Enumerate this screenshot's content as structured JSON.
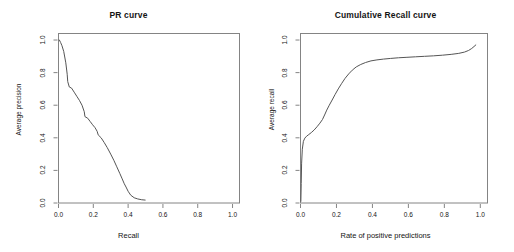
{
  "figure": {
    "width": 514,
    "height": 252,
    "background": "#ffffff",
    "line_color": "#555555",
    "axis_color": "#848484"
  },
  "panels": [
    {
      "id": "pr-curve",
      "title": "PR curve",
      "xlabel": "Recall",
      "ylabel": "Average precision",
      "xticks": [
        "0.0",
        "0.2",
        "0.4",
        "0.6",
        "0.8",
        "1.0"
      ],
      "xtick_values": [
        0.0,
        0.2,
        0.4,
        0.6,
        0.8,
        1.0
      ],
      "yticks": [
        "0.0",
        "0.2",
        "0.4",
        "0.6",
        "0.8",
        "1.0"
      ],
      "ytick_values": [
        0.0,
        0.2,
        0.4,
        0.6,
        0.8,
        1.0
      ]
    },
    {
      "id": "cumulative-recall-curve",
      "title": "Cumulative Recall curve",
      "xlabel": "Rate of positive predictions",
      "ylabel": "Average recall",
      "xticks": [
        "0.0",
        "0.2",
        "0.4",
        "0.6",
        "0.8",
        "1.0"
      ],
      "xtick_values": [
        0.0,
        0.2,
        0.4,
        0.6,
        0.8,
        1.0
      ],
      "yticks": [
        "0.0",
        "0.2",
        "0.4",
        "0.6",
        "0.8",
        "1.0"
      ],
      "ytick_values": [
        0.0,
        0.2,
        0.4,
        0.6,
        0.8,
        1.0
      ]
    }
  ],
  "chart_data": [
    {
      "type": "line",
      "id": "pr-curve",
      "title": "PR curve",
      "xlabel": "Recall",
      "ylabel": "Average precision",
      "xlim": [
        0.0,
        1.04
      ],
      "ylim": [
        0.0,
        1.04
      ],
      "grid": false,
      "legend": "none",
      "x": [
        0.005,
        0.012,
        0.02,
        0.03,
        0.042,
        0.05,
        0.053,
        0.062,
        0.075,
        0.09,
        0.105,
        0.12,
        0.135,
        0.148,
        0.152,
        0.168,
        0.182,
        0.196,
        0.21,
        0.222,
        0.228,
        0.245,
        0.262,
        0.28,
        0.3,
        0.318,
        0.335,
        0.352,
        0.366,
        0.378,
        0.388,
        0.4,
        0.415,
        0.435,
        0.455,
        0.478,
        0.498
      ],
      "y": [
        1.0,
        0.985,
        0.965,
        0.93,
        0.86,
        0.79,
        0.745,
        0.712,
        0.705,
        0.68,
        0.655,
        0.63,
        0.6,
        0.56,
        0.53,
        0.52,
        0.5,
        0.48,
        0.462,
        0.44,
        0.418,
        0.4,
        0.372,
        0.34,
        0.3,
        0.262,
        0.222,
        0.182,
        0.148,
        0.118,
        0.098,
        0.072,
        0.048,
        0.032,
        0.025,
        0.02,
        0.018
      ]
    },
    {
      "type": "line",
      "id": "cumulative-recall-curve",
      "title": "Cumulative Recall curve",
      "xlabel": "Rate of positive predictions",
      "ylabel": "Average recall",
      "xlim": [
        0.0,
        1.04
      ],
      "ylim": [
        0.0,
        1.04
      ],
      "grid": false,
      "legend": "none",
      "x": [
        0.002,
        0.004,
        0.006,
        0.01,
        0.016,
        0.024,
        0.034,
        0.046,
        0.06,
        0.076,
        0.092,
        0.108,
        0.122,
        0.134,
        0.146,
        0.16,
        0.176,
        0.192,
        0.21,
        0.228,
        0.248,
        0.268,
        0.288,
        0.31,
        0.335,
        0.362,
        0.392,
        0.425,
        0.462,
        0.5,
        0.545,
        0.592,
        0.64,
        0.69,
        0.74,
        0.79,
        0.838,
        0.88,
        0.912,
        0.935,
        0.952,
        0.965,
        0.975
      ],
      "y": [
        0.01,
        0.12,
        0.24,
        0.33,
        0.378,
        0.398,
        0.41,
        0.42,
        0.432,
        0.448,
        0.468,
        0.49,
        0.512,
        0.54,
        0.57,
        0.6,
        0.632,
        0.665,
        0.7,
        0.732,
        0.765,
        0.792,
        0.815,
        0.835,
        0.85,
        0.862,
        0.872,
        0.878,
        0.883,
        0.887,
        0.891,
        0.894,
        0.897,
        0.9,
        0.903,
        0.907,
        0.912,
        0.918,
        0.926,
        0.936,
        0.948,
        0.96,
        0.97
      ]
    }
  ]
}
